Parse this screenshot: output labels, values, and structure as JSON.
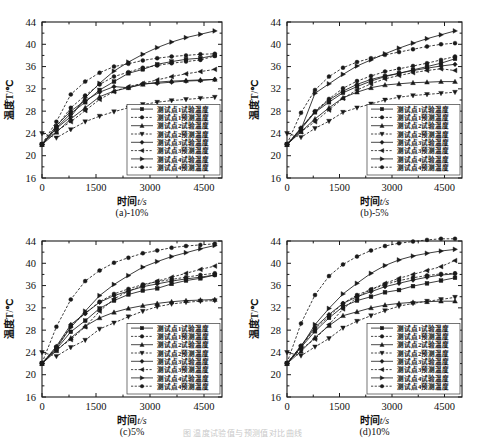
{
  "figure": {
    "background": "#ffffff",
    "ink": "#1a1a1a",
    "footer_fragment": "图 温度试验值与预测值对比曲线"
  },
  "axis": {
    "xlabel_cn": "时间",
    "xlabel_var": "t",
    "xlabel_unit": "/s",
    "ylabel": "温度T/℃",
    "xticks": [
      "0",
      "1500",
      "3000",
      "4500"
    ],
    "xtick_values": [
      0,
      1500,
      3000,
      4500
    ],
    "yticks": [
      "16",
      "20",
      "24",
      "28",
      "32",
      "36",
      "40",
      "44"
    ],
    "ytick_values": [
      16,
      20,
      24,
      28,
      32,
      36,
      40,
      44
    ],
    "xlim": [
      0,
      5000
    ],
    "ylim": [
      16,
      44
    ]
  },
  "legend": {
    "position": "lower-right-inside",
    "entries": [
      {
        "label": "测试点1试验温度",
        "marker": "square",
        "line": "solid"
      },
      {
        "label": "测试点1预测温度",
        "marker": "circle",
        "line": "dashed"
      },
      {
        "label": "测试点2试验温度",
        "marker": "triangle-up",
        "line": "solid"
      },
      {
        "label": "测试点2预测温度",
        "marker": "triangle-down",
        "line": "dashed"
      },
      {
        "label": "测试点3试验温度",
        "marker": "diamond",
        "line": "solid"
      },
      {
        "label": "测试点3预测温度",
        "marker": "triangle-left",
        "line": "dashed"
      },
      {
        "label": "测试点4试验温度",
        "marker": "triangle-right",
        "line": "solid"
      },
      {
        "label": "测试点4预测温度",
        "marker": "circle",
        "line": "dashed"
      }
    ]
  },
  "panels": [
    {
      "id": "a",
      "caption": "(a)-10%"
    },
    {
      "id": "b",
      "caption": "(b)-5%"
    },
    {
      "id": "c",
      "caption": "(c)5%"
    },
    {
      "id": "d",
      "caption": "(d)10%"
    }
  ],
  "chart_data": [
    {
      "type": "line",
      "id": "a",
      "title": "(a)-10%",
      "xlabel": "时间t /s",
      "ylabel": "温度T/℃",
      "xlim": [
        0,
        5000
      ],
      "ylim": [
        16,
        44
      ],
      "grid": false,
      "legend": "inside lower-right",
      "x": [
        0,
        400,
        800,
        1200,
        1600,
        2000,
        2400,
        2800,
        3200,
        3600,
        4000,
        4400,
        4800
      ],
      "series": [
        {
          "name": "测试点1试验温度",
          "marker": "square",
          "line": "solid",
          "values": [
            22.0,
            25.0,
            27.6,
            29.6,
            31.8,
            33.3,
            34.8,
            35.5,
            36.4,
            36.9,
            37.3,
            37.5,
            38.0
          ]
        },
        {
          "name": "测试点1预测温度",
          "marker": "circle",
          "line": "dashed",
          "values": [
            22.1,
            25.2,
            28.6,
            30.8,
            32.8,
            34.2,
            35.0,
            35.8,
            36.2,
            36.6,
            36.9,
            37.2,
            37.9
          ]
        },
        {
          "name": "测试点2试验温度",
          "marker": "triangle-up",
          "line": "solid",
          "values": [
            22.0,
            24.2,
            26.6,
            28.6,
            30.6,
            31.6,
            32.2,
            32.8,
            33.2,
            33.4,
            33.5,
            33.6,
            33.7
          ]
        },
        {
          "name": "测试点2预测温度",
          "marker": "triangle-down",
          "line": "dashed",
          "values": [
            24.0,
            23.2,
            24.7,
            26.1,
            27.1,
            27.9,
            28.6,
            29.2,
            29.6,
            29.9,
            30.1,
            30.3,
            30.5
          ]
        },
        {
          "name": "测试点3试验温度",
          "marker": "diamond",
          "line": "solid",
          "values": [
            22.0,
            25.4,
            28.0,
            29.9,
            31.4,
            32.4,
            32.2,
            32.9,
            33.0,
            33.2,
            33.4,
            33.5,
            33.7
          ]
        },
        {
          "name": "测试点3预测温度",
          "marker": "triangle-left",
          "line": "dashed",
          "values": [
            22.1,
            24.4,
            26.1,
            28.1,
            30.1,
            31.5,
            32.4,
            33.0,
            33.6,
            34.2,
            34.7,
            35.1,
            35.5
          ]
        },
        {
          "name": "测试点4试验温度",
          "marker": "triangle-right",
          "line": "solid",
          "values": [
            22.0,
            24.9,
            27.0,
            30.4,
            33.0,
            35.2,
            36.8,
            38.2,
            39.4,
            40.4,
            41.2,
            41.8,
            42.4
          ]
        },
        {
          "name": "测试点4预测温度",
          "marker": "circle",
          "line": "dashed",
          "values": [
            22.1,
            26.1,
            31.0,
            33.3,
            34.9,
            36.0,
            36.5,
            37.1,
            37.5,
            37.8,
            38.0,
            38.2,
            38.3
          ]
        }
      ]
    },
    {
      "type": "line",
      "id": "b",
      "title": "(b)-5%",
      "xlabel": "时间t /s",
      "ylabel": "温度T/℃",
      "xlim": [
        0,
        5000
      ],
      "ylim": [
        16,
        44
      ],
      "grid": false,
      "legend": "inside lower-right",
      "x": [
        0,
        400,
        800,
        1200,
        1600,
        2000,
        2400,
        2800,
        3200,
        3600,
        4000,
        4400,
        4800
      ],
      "series": [
        {
          "name": "测试点1试验温度",
          "marker": "square",
          "line": "solid",
          "values": [
            22.0,
            24.8,
            27.8,
            29.6,
            31.3,
            32.4,
            33.4,
            34.2,
            34.8,
            35.4,
            36.0,
            36.6,
            37.4
          ]
        },
        {
          "name": "测试点1预测温度",
          "marker": "circle",
          "line": "dashed",
          "values": [
            22.1,
            24.9,
            28.0,
            30.2,
            32.1,
            33.4,
            34.3,
            35.1,
            35.6,
            36.1,
            36.6,
            37.2,
            37.8
          ]
        },
        {
          "name": "测试点2试验温度",
          "marker": "triangle-up",
          "line": "solid",
          "values": [
            22.0,
            24.3,
            26.6,
            28.6,
            30.4,
            31.4,
            32.2,
            32.7,
            32.9,
            33.1,
            33.2,
            33.3,
            33.3
          ]
        },
        {
          "name": "测试点2预测温度",
          "marker": "triangle-down",
          "line": "dashed",
          "values": [
            24.0,
            23.3,
            24.9,
            26.2,
            27.8,
            28.6,
            29.3,
            30.0,
            30.5,
            30.8,
            31.0,
            31.2,
            31.4
          ]
        },
        {
          "name": "测试点3试验温度",
          "marker": "diamond",
          "line": "solid",
          "values": [
            22.0,
            25.0,
            27.9,
            30.0,
            31.6,
            32.8,
            33.7,
            34.3,
            34.8,
            35.3,
            35.7,
            36.1,
            36.4
          ]
        },
        {
          "name": "测试点3预测温度",
          "marker": "triangle-left",
          "line": "dashed",
          "values": [
            22.1,
            24.3,
            26.1,
            28.2,
            30.3,
            31.8,
            32.9,
            33.8,
            34.4,
            34.9,
            35.3,
            35.6,
            35.3
          ]
        },
        {
          "name": "测试点4试验温度",
          "marker": "triangle-right",
          "line": "solid",
          "values": [
            22.0,
            24.7,
            31.2,
            32.9,
            34.6,
            36.1,
            37.2,
            38.3,
            39.3,
            40.2,
            41.0,
            41.7,
            42.4
          ]
        },
        {
          "name": "测试点4预测温度",
          "marker": "circle",
          "line": "dashed",
          "values": [
            22.1,
            27.7,
            31.8,
            34.2,
            35.8,
            36.8,
            37.5,
            38.1,
            38.6,
            39.1,
            39.6,
            40.0,
            40.2
          ]
        }
      ]
    },
    {
      "type": "line",
      "id": "c",
      "title": "(c)5%",
      "xlabel": "时间t /s",
      "ylabel": "温度T/℃",
      "xlim": [
        0,
        5000
      ],
      "ylim": [
        16,
        44
      ],
      "grid": false,
      "legend": "inside lower-right",
      "x": [
        0,
        400,
        800,
        1200,
        1600,
        2000,
        2400,
        2800,
        3200,
        3600,
        4000,
        4400,
        4800
      ],
      "series": [
        {
          "name": "测试点1试验温度",
          "marker": "square",
          "line": "solid",
          "values": [
            22.0,
            24.6,
            27.7,
            29.7,
            31.9,
            33.3,
            34.4,
            35.1,
            35.5,
            36.3,
            36.9,
            37.3,
            37.9
          ]
        },
        {
          "name": "测试点1预测温度",
          "marker": "circle",
          "line": "dashed",
          "values": [
            22.1,
            24.9,
            28.7,
            31.0,
            33.1,
            34.5,
            35.4,
            36.2,
            36.7,
            37.1,
            37.5,
            37.9,
            38.2
          ]
        },
        {
          "name": "测试点2试验温度",
          "marker": "triangle-up",
          "line": "solid",
          "values": [
            22.0,
            24.3,
            26.6,
            28.7,
            30.2,
            31.2,
            31.9,
            32.4,
            32.8,
            33.1,
            33.3,
            33.4,
            33.5
          ]
        },
        {
          "name": "测试点2预测温度",
          "marker": "triangle-down",
          "line": "dashed",
          "values": [
            24.0,
            23.3,
            24.9,
            26.2,
            28.2,
            29.3,
            30.4,
            31.4,
            32.2,
            32.7,
            33.0,
            33.2,
            33.3
          ]
        },
        {
          "name": "测试点3试验温度",
          "marker": "diamond",
          "line": "solid",
          "values": [
            22.0,
            25.1,
            29.0,
            31.0,
            33.0,
            34.2,
            35.0,
            35.8,
            36.3,
            36.8,
            37.2,
            37.5,
            37.9
          ]
        },
        {
          "name": "测试点3预测温度",
          "marker": "triangle-left",
          "line": "dashed",
          "values": [
            22.1,
            24.5,
            26.3,
            28.6,
            31.4,
            33.6,
            35.0,
            36.0,
            36.8,
            37.5,
            38.2,
            38.9,
            39.5
          ]
        },
        {
          "name": "测试点4试验温度",
          "marker": "triangle-right",
          "line": "solid",
          "values": [
            22.0,
            24.8,
            28.5,
            31.4,
            34.2,
            36.2,
            37.8,
            39.3,
            40.3,
            41.2,
            41.9,
            42.6,
            43.2
          ]
        },
        {
          "name": "测试点4预测温度",
          "marker": "circle",
          "line": "dashed",
          "values": [
            22.1,
            28.6,
            33.5,
            36.8,
            38.7,
            40.1,
            41.0,
            41.8,
            42.3,
            42.8,
            43.1,
            43.3,
            43.5
          ]
        }
      ]
    },
    {
      "type": "line",
      "id": "d",
      "title": "(d)10%",
      "xlabel": "时间t /s",
      "ylabel": "温度T/℃",
      "xlim": [
        0,
        5000
      ],
      "ylim": [
        16,
        44
      ],
      "grid": false,
      "legend": "inside lower-right",
      "x": [
        0,
        400,
        800,
        1200,
        1600,
        2000,
        2400,
        2800,
        3200,
        3600,
        4000,
        4400,
        4800
      ],
      "series": [
        {
          "name": "测试点1试验温度",
          "marker": "square",
          "line": "solid",
          "values": [
            22.0,
            24.9,
            27.8,
            30.2,
            32.2,
            33.3,
            34.0,
            34.8,
            35.2,
            35.9,
            36.4,
            36.9,
            37.4
          ]
        },
        {
          "name": "测试点1预测温度",
          "marker": "circle",
          "line": "dashed",
          "values": [
            22.1,
            25.1,
            28.2,
            30.5,
            32.8,
            34.3,
            35.3,
            36.2,
            36.9,
            37.4,
            37.8,
            38.1,
            38.2
          ]
        },
        {
          "name": "测试点2试验温度",
          "marker": "triangle-up",
          "line": "solid",
          "values": [
            22.0,
            24.2,
            26.7,
            28.8,
            30.6,
            31.3,
            32.0,
            32.5,
            32.8,
            33.0,
            33.1,
            33.2,
            33.2
          ]
        },
        {
          "name": "测试点2预测温度",
          "marker": "triangle-down",
          "line": "dashed",
          "values": [
            24.0,
            23.4,
            25.0,
            26.5,
            28.4,
            29.6,
            30.6,
            31.5,
            32.3,
            32.8,
            33.2,
            33.5,
            33.9
          ]
        },
        {
          "name": "测试点3试验温度",
          "marker": "diamond",
          "line": "solid",
          "values": [
            22.0,
            25.2,
            28.5,
            30.8,
            32.8,
            34.0,
            34.9,
            35.8,
            36.4,
            37.0,
            37.5,
            37.9,
            38.1
          ]
        },
        {
          "name": "测试点3预测温度",
          "marker": "triangle-left",
          "line": "dashed",
          "values": [
            22.1,
            24.6,
            26.4,
            29.0,
            31.8,
            33.9,
            35.3,
            36.4,
            37.3,
            38.0,
            38.7,
            39.4,
            40.5
          ]
        },
        {
          "name": "测试点4试验温度",
          "marker": "triangle-right",
          "line": "solid",
          "values": [
            22.0,
            25.0,
            29.0,
            31.9,
            34.5,
            36.4,
            38.2,
            39.6,
            40.6,
            41.3,
            41.8,
            42.2,
            42.5
          ]
        },
        {
          "name": "测试点4预测温度",
          "marker": "circle",
          "line": "dashed",
          "values": [
            22.1,
            29.2,
            34.3,
            37.7,
            39.8,
            41.2,
            42.3,
            43.1,
            43.6,
            43.9,
            44.2,
            44.4,
            44.4
          ]
        }
      ]
    }
  ]
}
